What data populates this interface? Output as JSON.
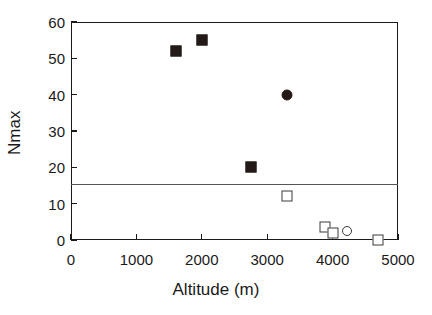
{
  "chart_data": {
    "type": "scatter",
    "title": "",
    "xlabel": "Altitude (m)",
    "ylabel": "Nmax",
    "xlim": [
      0,
      5000
    ],
    "ylim": [
      0,
      60
    ],
    "xticks": [
      0,
      1000,
      2000,
      3000,
      4000,
      5000
    ],
    "yticks": [
      0,
      10,
      20,
      30,
      40,
      50,
      60
    ],
    "xtick_labels": [
      "0",
      "1000",
      "2000",
      "3000",
      "4000",
      "5000"
    ],
    "ytick_labels": [
      "0",
      "10",
      "20",
      "30",
      "40",
      "50",
      "60"
    ],
    "grid": false,
    "legend": "none",
    "series": [
      {
        "name": "filled-square",
        "marker": "square-filled",
        "points": [
          {
            "x": 1600,
            "y": 52
          },
          {
            "x": 2000,
            "y": 55
          },
          {
            "x": 2750,
            "y": 20
          }
        ]
      },
      {
        "name": "filled-circle",
        "marker": "circle-filled",
        "points": [
          {
            "x": 3300,
            "y": 40
          }
        ]
      },
      {
        "name": "open-square",
        "marker": "square-open",
        "points": [
          {
            "x": 3300,
            "y": 12
          },
          {
            "x": 3890,
            "y": 3.5
          },
          {
            "x": 4010,
            "y": 2
          },
          {
            "x": 4700,
            "y": 0
          }
        ]
      },
      {
        "name": "open-circle",
        "marker": "circle-open",
        "points": [
          {
            "x": 4220,
            "y": 2.5
          }
        ]
      }
    ],
    "annotations": [
      {
        "name": "threshold-line",
        "type": "hline",
        "y": 15.5,
        "color": "#555555"
      }
    ],
    "colors": {
      "axis": "#1a1a1a",
      "marker_fill": "#231a17",
      "marker_open_edge": "#3a3a3a",
      "reference_line": "#555555",
      "background": "#ffffff"
    }
  },
  "geometry": {
    "plot_left": 71,
    "plot_top": 22,
    "plot_width": 327,
    "plot_height": 218
  }
}
